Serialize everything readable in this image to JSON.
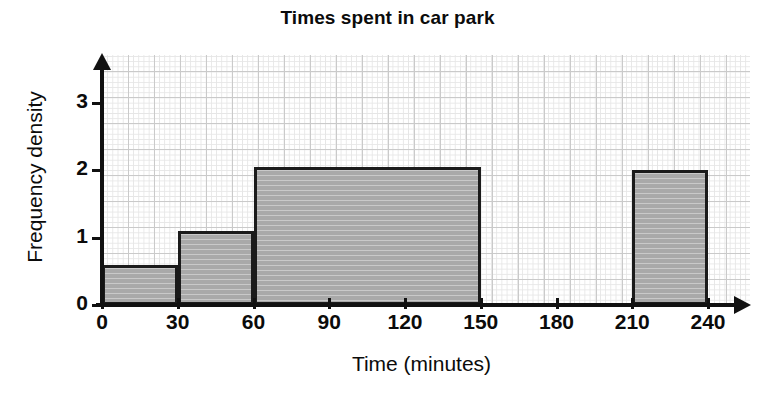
{
  "chart_data": {
    "type": "bar",
    "title": "Times spent in car park",
    "xlabel": "Time (minutes)",
    "ylabel": "Frequency density",
    "xlim": [
      0,
      240
    ],
    "ylim": [
      0,
      3.4
    ],
    "grid": true,
    "legend": null,
    "x_ticks": [
      {
        "value": 0,
        "label": "0"
      },
      {
        "value": 30,
        "label": "30"
      },
      {
        "value": 60,
        "label": "60"
      },
      {
        "value": 90,
        "label": "90"
      },
      {
        "value": 120,
        "label": "120"
      },
      {
        "value": 150,
        "label": "150"
      },
      {
        "value": 180,
        "label": "180"
      },
      {
        "value": 210,
        "label": "210"
      },
      {
        "value": 240,
        "label": "240"
      }
    ],
    "y_ticks": [
      {
        "value": 0,
        "label": "0"
      },
      {
        "value": 1,
        "label": "1"
      },
      {
        "value": 2,
        "label": "2"
      },
      {
        "value": 3,
        "label": "3"
      }
    ],
    "bars": [
      {
        "x_start": 0,
        "x_end": 30,
        "frequency_density": 0.6,
        "frequency": 18
      },
      {
        "x_start": 30,
        "x_end": 60,
        "frequency_density": 1.1,
        "frequency": 33
      },
      {
        "x_start": 60,
        "x_end": 150,
        "frequency_density": 2.05,
        "frequency": 184.5
      },
      {
        "x_start": 210,
        "x_end": 240,
        "frequency_density": 2.0,
        "frequency": 60
      }
    ],
    "colors": {
      "bar_fill": "#b2b2b2",
      "bar_border": "#1b1b1b",
      "axis": "#111111",
      "grid_minor": "#dedede",
      "grid_major": "#b9b9b9",
      "background": "#ffffff"
    }
  }
}
